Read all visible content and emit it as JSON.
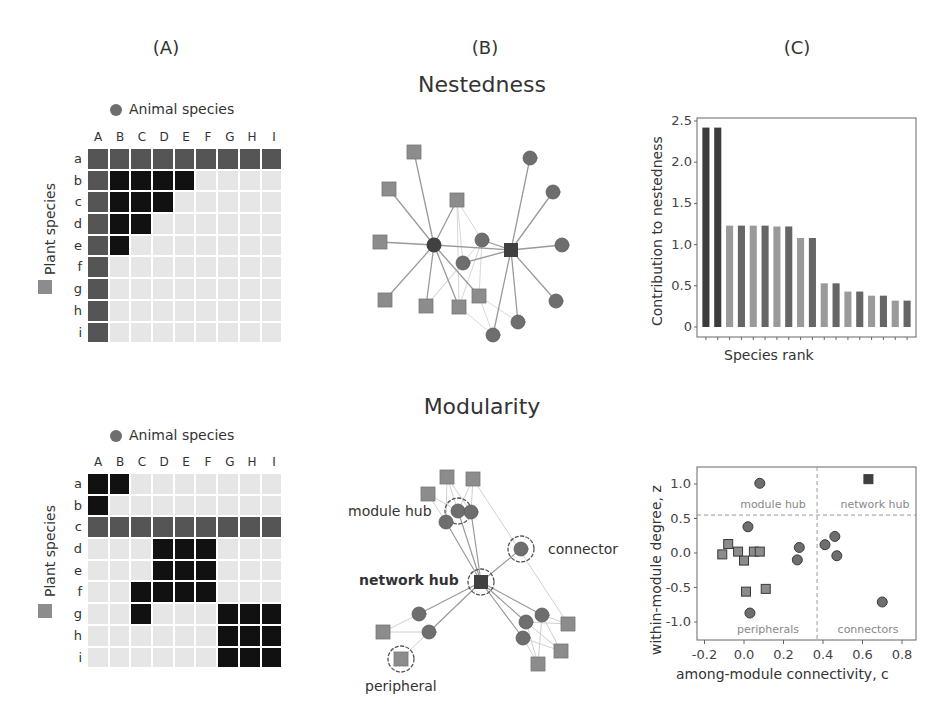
{
  "panels": {
    "a_label": "(A)",
    "b_label": "(B)",
    "c_label": "(C)"
  },
  "titles": {
    "nestedness": "Nestedness",
    "modularity": "Modularity"
  },
  "legend": {
    "animal": "Animal species",
    "plant": "Plant species"
  },
  "colors": {
    "empty": "#e6e6e6",
    "generalist": "#555555",
    "interaction": "#111111",
    "plant_node": "#8c8c8c",
    "animal_node": "#6e6e6e",
    "hub_node": "#404040"
  },
  "matrix_cols": [
    "A",
    "B",
    "C",
    "D",
    "E",
    "F",
    "G",
    "H",
    "I"
  ],
  "matrix_rows": [
    "a",
    "b",
    "c",
    "d",
    "e",
    "f",
    "g",
    "h",
    "i"
  ],
  "nested_matrix": [
    [
      1,
      1,
      1,
      1,
      1,
      1,
      1,
      1,
      1
    ],
    [
      1,
      2,
      2,
      2,
      2,
      0,
      0,
      0,
      0
    ],
    [
      1,
      2,
      2,
      2,
      0,
      0,
      0,
      0,
      0
    ],
    [
      1,
      2,
      2,
      0,
      0,
      0,
      0,
      0,
      0
    ],
    [
      1,
      2,
      0,
      0,
      0,
      0,
      0,
      0,
      0
    ],
    [
      1,
      0,
      0,
      0,
      0,
      0,
      0,
      0,
      0
    ],
    [
      1,
      0,
      0,
      0,
      0,
      0,
      0,
      0,
      0
    ],
    [
      1,
      0,
      0,
      0,
      0,
      0,
      0,
      0,
      0
    ],
    [
      1,
      0,
      0,
      0,
      0,
      0,
      0,
      0,
      0
    ]
  ],
  "modular_matrix": [
    [
      2,
      2,
      0,
      0,
      0,
      0,
      0,
      0,
      0
    ],
    [
      2,
      0,
      0,
      0,
      0,
      0,
      0,
      0,
      0
    ],
    [
      1,
      1,
      1,
      1,
      1,
      1,
      1,
      1,
      1
    ],
    [
      0,
      0,
      0,
      2,
      2,
      2,
      0,
      0,
      0
    ],
    [
      0,
      0,
      0,
      2,
      2,
      2,
      0,
      0,
      0
    ],
    [
      0,
      0,
      2,
      2,
      2,
      2,
      0,
      0,
      0
    ],
    [
      0,
      0,
      2,
      0,
      0,
      0,
      2,
      2,
      2
    ],
    [
      0,
      0,
      0,
      0,
      0,
      0,
      2,
      2,
      2
    ],
    [
      0,
      0,
      0,
      0,
      0,
      0,
      2,
      2,
      2
    ]
  ],
  "network_labels": {
    "module_hub": "module hub",
    "network_hub": "network hub",
    "connector": "connector",
    "peripheral": "peripheral"
  },
  "chart_data": [
    {
      "type": "bar",
      "title": "",
      "xlabel": "Species rank",
      "ylabel": "Contribution to nestedness",
      "ylim": [
        0,
        2.5
      ],
      "yticks": [
        "0",
        "0.5",
        "1.0",
        "1.5",
        "2.0",
        "2.5"
      ],
      "categories": [
        1,
        2,
        3,
        4,
        5,
        6,
        7,
        8,
        9,
        10,
        11,
        12,
        13,
        14,
        15,
        16,
        17,
        18
      ],
      "values": [
        2.42,
        2.42,
        1.23,
        1.23,
        1.23,
        1.23,
        1.22,
        1.22,
        1.08,
        1.08,
        0.53,
        0.53,
        0.43,
        0.43,
        0.38,
        0.38,
        0.32,
        0.32
      ],
      "bar_colors": [
        "#3c3c3c",
        "#3c3c3c",
        "#9a9a9a",
        "#666666",
        "#9a9a9a",
        "#666666",
        "#9a9a9a",
        "#666666",
        "#9a9a9a",
        "#666666",
        "#9a9a9a",
        "#666666",
        "#9a9a9a",
        "#666666",
        "#9a9a9a",
        "#666666",
        "#9a9a9a",
        "#666666"
      ],
      "grid": false
    },
    {
      "type": "scatter",
      "title": "",
      "xlabel": "among-module connectivity, c",
      "ylabel": "within-module degree, z",
      "xlim": [
        -0.22,
        0.88
      ],
      "ylim": [
        -1.25,
        1.25
      ],
      "xticks": [
        "-0.2",
        "0.0",
        "0.2",
        "0.4",
        "0.6",
        "0.8"
      ],
      "yticks": [
        "1.0",
        "0.5",
        "0.0",
        "-0.5",
        "-1.0"
      ],
      "thresholds": {
        "c": 0.37,
        "z": 0.55
      },
      "region_labels": [
        "module hub",
        "network hub",
        "peripherals",
        "connectors"
      ],
      "series": [
        {
          "name": "Animal species",
          "marker": "circle",
          "points": [
            [
              0.08,
              1.01
            ],
            [
              0.02,
              0.38
            ],
            [
              0.28,
              0.08
            ],
            [
              0.27,
              -0.1
            ],
            [
              0.41,
              0.12
            ],
            [
              0.46,
              0.24
            ],
            [
              0.47,
              -0.04
            ],
            [
              0.7,
              -0.71
            ],
            [
              0.03,
              -0.87
            ]
          ]
        },
        {
          "name": "Plant species",
          "marker": "square",
          "points": [
            [
              -0.11,
              -0.02
            ],
            [
              -0.08,
              0.13
            ],
            [
              -0.03,
              0.02
            ],
            [
              0.0,
              -0.11
            ],
            [
              0.05,
              0.02
            ],
            [
              0.08,
              0.02
            ],
            [
              0.01,
              -0.56
            ],
            [
              0.11,
              -0.52
            ]
          ]
        },
        {
          "name": "Network hub",
          "marker": "square",
          "points": [
            [
              0.63,
              1.07
            ]
          ]
        }
      ]
    }
  ]
}
